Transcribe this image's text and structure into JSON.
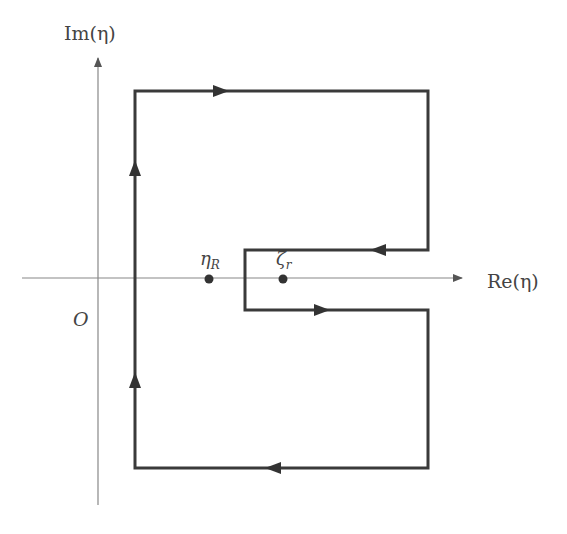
{
  "diagram": {
    "axes": {
      "x_label": "Re(η)",
      "y_label": "Im(η)",
      "origin_label": "O"
    },
    "points": [
      {
        "id": "eta_R",
        "label": "η",
        "subscript": "R"
      },
      {
        "id": "zeta_r",
        "label": "ζ",
        "subscript": "r"
      }
    ],
    "colors": {
      "contour": "#3a3a3a",
      "axis": "#888888",
      "text": "#444444"
    }
  }
}
